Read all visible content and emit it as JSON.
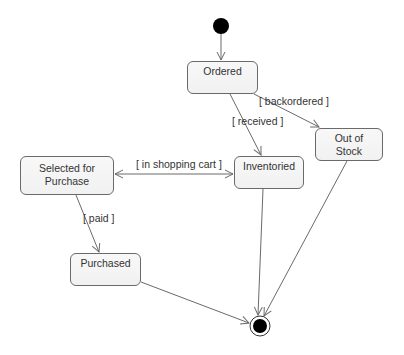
{
  "diagram": {
    "type": "UML state machine",
    "initial_state": {
      "x": 221,
      "y": 26,
      "r": 8
    },
    "final_state": {
      "x": 260,
      "y": 326,
      "r_outer": 10,
      "r_inner": 7
    },
    "states": [
      {
        "id": "ordered",
        "label": "Ordered",
        "x": 187,
        "y": 61,
        "w": 71,
        "h": 33
      },
      {
        "id": "out_of_stock",
        "label_line1": "Out of",
        "label_line2": "Stock",
        "x": 315,
        "y": 128,
        "w": 68,
        "h": 33
      },
      {
        "id": "inventoried",
        "label": "Inventoried",
        "x": 234,
        "y": 156,
        "w": 70,
        "h": 33
      },
      {
        "id": "selected",
        "label_line1": "Selected for",
        "label_line2": "Purchase",
        "x": 20,
        "y": 156,
        "w": 94,
        "h": 39
      },
      {
        "id": "purchased",
        "label": "Purchased",
        "x": 70,
        "y": 253,
        "w": 71,
        "h": 33
      }
    ],
    "guards": {
      "backordered": "[ backordered ]",
      "received": "[ received ]",
      "in_shopping_cart": "[ in shopping cart ]",
      "paid": "[ paid ]"
    },
    "colors": {
      "line": "#6a6a6a",
      "state_fill": "#f4f4f4",
      "node_fill": "#000000"
    }
  }
}
